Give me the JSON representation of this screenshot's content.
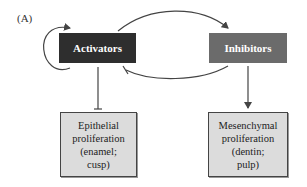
{
  "panel_label": "(A)",
  "nodes": {
    "activators": {
      "label": "Activators",
      "color": "#2e2e2e"
    },
    "inhibitors": {
      "label": "Inhibitors",
      "color": "#6b6b6b"
    },
    "epithelial": {
      "label": "Epithelial\nproliferation\n(enamel;\ncusp)",
      "color": "#dcdcdc"
    },
    "mesenchymal": {
      "label": "Mesenchymal\nproliferation\n(dentin;\npulp)",
      "color": "#dcdcdc"
    }
  },
  "edges": [
    {
      "from": "activators",
      "to": "activators",
      "type": "activation",
      "desc": "self-loop"
    },
    {
      "from": "activators",
      "to": "inhibitors",
      "type": "activation"
    },
    {
      "from": "inhibitors",
      "to": "activators",
      "type": "inhibition"
    },
    {
      "from": "activators",
      "to": "epithelial",
      "type": "inhibition"
    },
    {
      "from": "inhibitors",
      "to": "mesenchymal",
      "type": "activation"
    }
  ]
}
